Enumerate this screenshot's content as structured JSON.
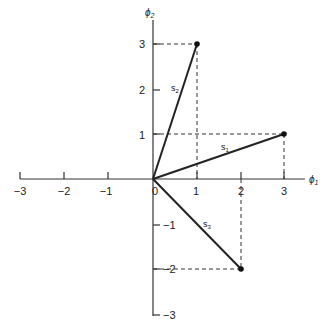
{
  "diagram": {
    "type": "signal-space vector diagram",
    "axes": {
      "x": {
        "label": "ϕ1",
        "ticks": [
          "−3",
          "−2",
          "−1",
          "0",
          "1",
          "2",
          "3"
        ],
        "range": [
          -3,
          3
        ]
      },
      "y": {
        "label": "ϕ2",
        "ticks": [
          "3",
          "2",
          "1",
          "−1",
          "−2",
          "−3"
        ],
        "range": [
          -3,
          3
        ]
      }
    },
    "vectors": [
      {
        "name": "s1",
        "label": "s",
        "sub": "1",
        "x": 3,
        "y": 1
      },
      {
        "name": "s2",
        "label": "s",
        "sub": "2",
        "x": 1,
        "y": 3
      },
      {
        "name": "s3",
        "label": "s",
        "sub": "3",
        "x": 2,
        "y": -2
      }
    ],
    "colors": {
      "ink": "#222222",
      "background": "#ffffff"
    }
  },
  "labels": {
    "x_axis": "ϕ",
    "x_axis_sub": "1",
    "y_axis": "ϕ",
    "y_axis_sub": "2",
    "origin": "0",
    "xt_m3": "−3",
    "xt_m2": "−2",
    "xt_m1": "−1",
    "xt_1": "1",
    "xt_2": "2",
    "xt_3": "3",
    "yt_3": "3",
    "yt_2": "2",
    "yt_1": "1",
    "yt_m1": "−1",
    "yt_m2": "−2",
    "yt_m3": "−3",
    "s1": "s",
    "s1_sub": "1",
    "s2": "s",
    "s2_sub": "2",
    "s3": "s",
    "s3_sub": "3"
  }
}
